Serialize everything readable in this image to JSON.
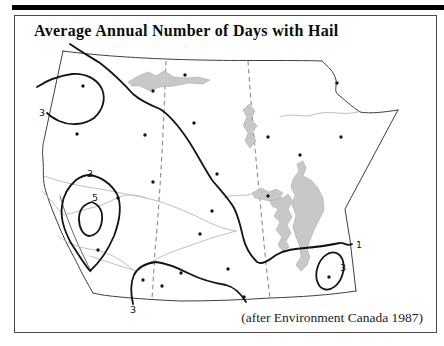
{
  "figure": {
    "title": "Average Annual Number of Days with Hail",
    "attribution": "(after Environment Canada 1987)"
  },
  "map": {
    "colors": {
      "contour": "#141414",
      "province_border": "#3f3f3f",
      "dashed_border": "#8a8a8a",
      "river": "#bfbfbf",
      "lake_fill": "#c8c8c8",
      "frame": "#4a4a4a",
      "page_bar": "#000000"
    },
    "contour_labels": [
      {
        "value": "3",
        "x": 42,
        "y": 116
      },
      {
        "value": "3",
        "x": 90,
        "y": 177
      },
      {
        "value": "5",
        "x": 95,
        "y": 201
      },
      {
        "value": "3",
        "x": 133,
        "y": 313
      },
      {
        "value": "1",
        "x": 359,
        "y": 248
      },
      {
        "value": "3",
        "x": 343,
        "y": 271
      }
    ],
    "stations": [
      {
        "x": 83,
        "y": 86
      },
      {
        "x": 77,
        "y": 134
      },
      {
        "x": 145,
        "y": 135
      },
      {
        "x": 185,
        "y": 75
      },
      {
        "x": 153,
        "y": 91
      },
      {
        "x": 194,
        "y": 123
      },
      {
        "x": 217,
        "y": 174
      },
      {
        "x": 268,
        "y": 137
      },
      {
        "x": 153,
        "y": 182
      },
      {
        "x": 118,
        "y": 198
      },
      {
        "x": 212,
        "y": 211
      },
      {
        "x": 200,
        "y": 234
      },
      {
        "x": 98,
        "y": 250
      },
      {
        "x": 143,
        "y": 280
      },
      {
        "x": 162,
        "y": 286
      },
      {
        "x": 181,
        "y": 273
      },
      {
        "x": 228,
        "y": 269
      },
      {
        "x": 244,
        "y": 297
      },
      {
        "x": 268,
        "y": 196
      },
      {
        "x": 300,
        "y": 155
      },
      {
        "x": 337,
        "y": 83
      },
      {
        "x": 341,
        "y": 137
      },
      {
        "x": 329,
        "y": 277
      }
    ]
  }
}
